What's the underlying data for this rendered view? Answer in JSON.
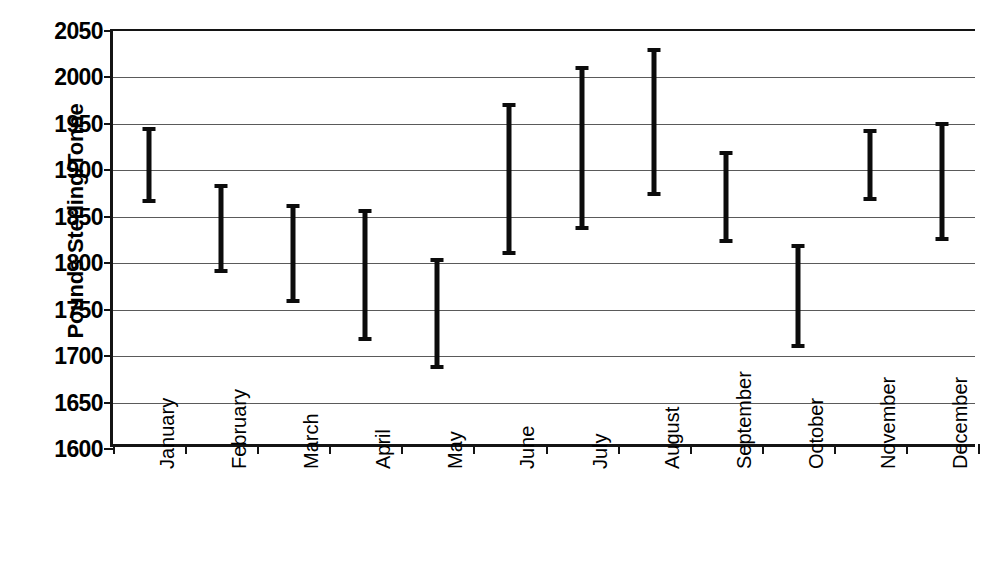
{
  "chart_data": {
    "type": "bar",
    "subtype": "high-low-range",
    "title": "",
    "xlabel": "",
    "ylabel": "Pounds Sterling/Tonne",
    "ylim": [
      1600,
      2050
    ],
    "ytick_step": 50,
    "ytick_labels": [
      "2050",
      "2000",
      "1950",
      "1900",
      "1850",
      "1800",
      "1750",
      "1700",
      "1650",
      "1600"
    ],
    "yticks": [
      2050,
      2000,
      1950,
      1900,
      1850,
      1800,
      1750,
      1700,
      1650,
      1600
    ],
    "grid": true,
    "grid_axis": "y",
    "legend": "none",
    "categories": [
      "January",
      "February",
      "March",
      "April",
      "May",
      "June",
      "July",
      "August",
      "September",
      "October",
      "November",
      "December"
    ],
    "series": [
      {
        "name": "Low",
        "values": [
          1865,
          1790,
          1757,
          1716,
          1686,
          1809,
          1836,
          1872,
          1822,
          1709,
          1867,
          1824
        ]
      },
      {
        "name": "High",
        "values": [
          1947,
          1885,
          1864,
          1858,
          1806,
          1972,
          2012,
          2032,
          1921,
          1821,
          1945,
          1952
        ]
      }
    ],
    "colors": {
      "bar": "#0c0c0c",
      "axis": "#141414",
      "grid": "#5a5a5a",
      "background": "#ffffff"
    }
  }
}
